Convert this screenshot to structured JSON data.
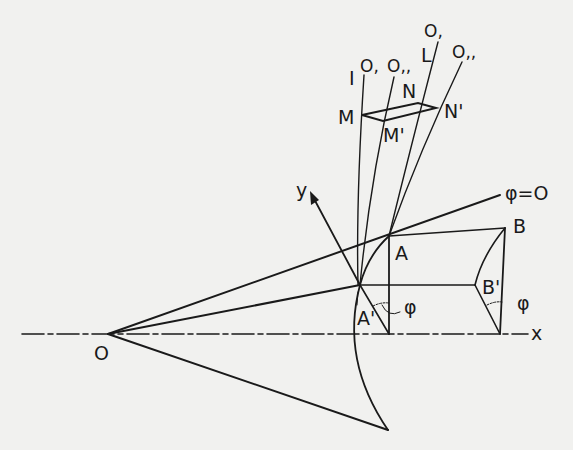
{
  "figure": {
    "type": "geometric-construction",
    "ink_color": "#1a1a1a",
    "paper_color": "#f1f1ef"
  },
  "labels": {
    "origin": "O",
    "x_axis": "x",
    "y_axis": "y",
    "phi_zero": "φ=O",
    "point_A": "A",
    "point_A_prime": "A'",
    "point_B": "B",
    "point_B_prime": "B'",
    "angle_phi_1": "φ",
    "angle_phi_2": "φ",
    "point_M": "M",
    "point_M_prime": "M'",
    "point_N": "N",
    "point_N_prime": "N'",
    "line_I": "I",
    "line_L": "L",
    "curve_O1_left": "O,",
    "curve_O2_left": "O,,",
    "curve_O1_right": "O,",
    "curve_O2_right": "O,,"
  }
}
